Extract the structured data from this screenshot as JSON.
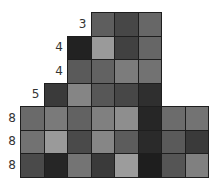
{
  "puzzle": {
    "cell_size": 23.5,
    "origin_x": 20,
    "origin_y": 12,
    "rows": [
      {
        "label": "3",
        "start_col": 3,
        "cells": [
          "#5e5e5e",
          "#474747",
          "#676767"
        ]
      },
      {
        "label": "4",
        "start_col": 2,
        "cells": [
          "#222222",
          "#9a9a9a",
          "#414141",
          "#666666"
        ]
      },
      {
        "label": "4",
        "start_col": 2,
        "cells": [
          "#5a5a5a",
          "#626262",
          "#7c7c7c",
          "#727272"
        ]
      },
      {
        "label": "5",
        "start_col": 1,
        "cells": [
          "#3a3a3a",
          "#858585",
          "#575757",
          "#474747",
          "#2f2f2f"
        ]
      },
      {
        "label": "8",
        "start_col": 0,
        "cells": [
          "#6a6a6a",
          "#7a7a7a",
          "#626262",
          "#808080",
          "#8e8e8e",
          "#262626",
          "#6c6c6c",
          "#737373"
        ]
      },
      {
        "label": "8",
        "start_col": 0,
        "cells": [
          "#727272",
          "#9a9a9a",
          "#4a4a4a",
          "#868686",
          "#5c5c5c",
          "#2a2a2a",
          "#5a5a5a",
          "#3a3a3a"
        ]
      },
      {
        "label": "8",
        "start_col": 0,
        "cells": [
          "#4a4a4a",
          "#262626",
          "#747474",
          "#3a3a3a",
          "#9c9c9c",
          "#1e1e1e",
          "#555555",
          "#808080"
        ]
      }
    ]
  }
}
